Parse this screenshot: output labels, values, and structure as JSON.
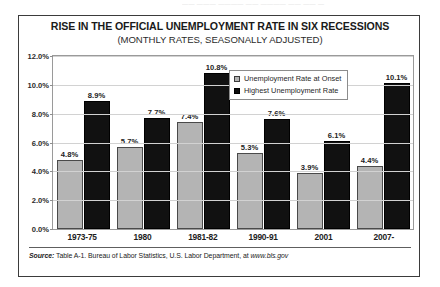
{
  "page": {
    "clipped_top_text": "——  ——— ———— —— ———— —— ——  —"
  },
  "chart_data": {
    "type": "bar",
    "title": "RISE IN THE OFFICIAL UNEMPLOYMENT RATE IN SIX RECESSIONS",
    "subtitle": "(MONTHLY RATES, SEASONALLY ADJUSTED)",
    "xlabel": "",
    "ylabel": "",
    "ylim": [
      0,
      12
    ],
    "ytick_labels": [
      "12.0%",
      "10.0%",
      "8.0%",
      "6.0%",
      "4.0%",
      "2.0%",
      "0.0%"
    ],
    "ytick_values": [
      12,
      10,
      8,
      6,
      4,
      2,
      0
    ],
    "grid": true,
    "legend_position": "top-right-inside",
    "categories": [
      "1973-75",
      "1980",
      "1981-82",
      "1990-91",
      "2001",
      "2007-"
    ],
    "series": [
      {
        "name": "Unemployment Rate at Onset",
        "color": "#b4b4b4",
        "values": [
          4.8,
          5.7,
          7.4,
          5.3,
          3.9,
          4.4
        ],
        "labels": [
          "4.8%",
          "5.7%",
          "7.4%",
          "5.3%",
          "3.9%",
          "4.4%"
        ]
      },
      {
        "name": "Highest Unemployment Rate",
        "color": "#111111",
        "values": [
          8.9,
          7.7,
          10.8,
          7.6,
          6.1,
          10.1
        ],
        "labels": [
          "8.9%",
          "7.7%",
          "10.8%",
          "7.6%",
          "6.1%",
          "10.1%"
        ]
      }
    ],
    "source": {
      "label": "Source:",
      "text": " Table A-1.  Bureau of Labor Statistics, U.S. Labor Department, at ",
      "url": "www.bls.gov"
    }
  }
}
